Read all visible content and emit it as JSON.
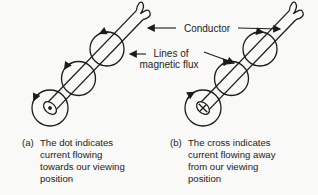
{
  "colors": {
    "ink": "#1c1c1c",
    "background": "#f9f9f7"
  },
  "labels": {
    "conductor": "Conductor",
    "flux_lines": [
      "Lines of",
      "magnetic flux"
    ]
  },
  "diagram_a": {
    "caption_prefix": "(a)",
    "caption_lines": [
      "The dot indicates",
      "current flowing",
      "towards our viewing",
      "position"
    ],
    "end_symbol": "dot",
    "flux_direction": "counterclockwise"
  },
  "diagram_b": {
    "caption_prefix": "(b)",
    "caption_lines": [
      "The cross indicates",
      "current flowing away",
      "from our viewing",
      "position"
    ],
    "end_symbol": "cross",
    "flux_direction": "clockwise"
  }
}
